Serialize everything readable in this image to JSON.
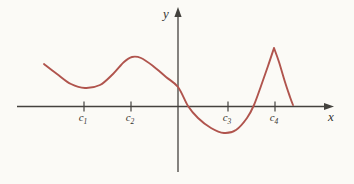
{
  "figure": {
    "background": "#fbfaf6",
    "axis_color": "#44423e",
    "label_color": "#35332f",
    "curve_color": "#b0544d",
    "x_axis_label": "x",
    "y_axis_label": "y",
    "ticks": [
      {
        "label": "c",
        "sub": "1",
        "x": 84
      },
      {
        "label": "c",
        "sub": "2",
        "x": 131
      },
      {
        "label": "c",
        "sub": "3",
        "x": 228
      },
      {
        "label": "c",
        "sub": "4",
        "x": 275
      }
    ],
    "layout": {
      "width": 354,
      "height": 184,
      "x_axis": {
        "y": 106.5,
        "x_start": 17,
        "x_line_end": 325,
        "arrow_tip_x": 334
      },
      "y_axis": {
        "x": 178,
        "y_top_line": 16,
        "y_bottom": 172,
        "arrow_tip_y": 7
      },
      "tick_half_height": 5,
      "tick_label_baseline_y": 121,
      "x_label_pos": {
        "x": 331,
        "y": 121
      },
      "y_label_pos": {
        "x": 166,
        "y": 18
      }
    }
  },
  "chart_data": {
    "type": "line",
    "title": "",
    "xlabel": "x",
    "ylabel": "y",
    "grid": false,
    "legend": false,
    "x_tick_labels": [
      "c1",
      "c2",
      "c3",
      "c4"
    ],
    "axis_numeric_labels": false,
    "features": [
      {
        "x": "c1",
        "feature": "smooth local minimum",
        "relative_to_x_axis": "above"
      },
      {
        "x": "c2",
        "feature": "smooth local maximum",
        "relative_to_x_axis": "above"
      },
      {
        "x": "c3",
        "feature": "smooth local minimum",
        "relative_to_x_axis": "below"
      },
      {
        "x": "c4",
        "feature": "sharp corner local maximum",
        "relative_to_x_axis": "above"
      }
    ],
    "x_axis_crossings_px": [
      188,
      254
    ],
    "series": [
      {
        "name": "curve",
        "color": "#b0544d",
        "points_px": {
          "segments": [
            [
              [
                44,
                64
              ],
              [
                57,
                74
              ],
              [
                71,
                84
              ],
              [
                85,
                88
              ],
              [
                100,
                85
              ],
              [
                113,
                74
              ],
              [
                124,
                62
              ],
              [
                132,
                57
              ],
              [
                141,
                58
              ],
              [
                153,
                66
              ],
              [
                166,
                77
              ],
              [
                178,
                87
              ],
              [
                188,
                106
              ],
              [
                198,
                118
              ],
              [
                211,
                128
              ],
              [
                224,
                133
              ],
              [
                236,
                130
              ],
              [
                247,
                118
              ],
              [
                254,
                105
              ],
              [
                261,
                86
              ],
              [
                268,
                66
              ],
              [
                274,
                48
              ]
            ],
            [
              [
                274,
                48
              ],
              [
                279,
                62
              ],
              [
                285,
                82
              ],
              [
                290,
                97
              ],
              [
                293,
                105
              ]
            ]
          ]
        }
      }
    ]
  }
}
